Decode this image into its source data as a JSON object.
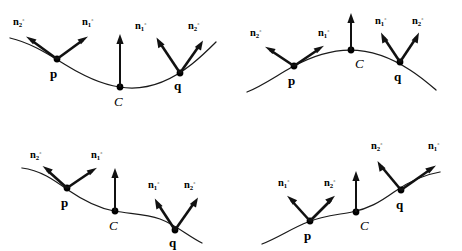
{
  "figure": {
    "background_color": "#ffffff",
    "stroke_color": "#111111",
    "curve_color": "#1a1a1a",
    "width": 462,
    "height": 251,
    "labels": {
      "n1": "n",
      "n2": "n",
      "sub1": "1",
      "sub2": "2",
      "sup_degree": "◦",
      "point_p": "p",
      "point_q": "q",
      "curve_c": "C"
    }
  },
  "panels": [
    {
      "id": "panel-top-left",
      "name": "concave-up-valley",
      "curve_shape": "valley",
      "description": "Concave-up curve with minimum at C",
      "points": [
        {
          "name": "p",
          "label": "p",
          "vectors": [
            {
              "name": "n2",
              "label_sub": "2",
              "direction": "up-left"
            },
            {
              "name": "n1",
              "label_sub": "1",
              "direction": "up-right"
            }
          ]
        },
        {
          "name": "C",
          "label": "C",
          "vectors": [
            {
              "name": "normal",
              "label_sub": "",
              "direction": "up"
            }
          ]
        },
        {
          "name": "q",
          "label": "q",
          "vectors": [
            {
              "name": "n1",
              "label_sub": "1",
              "direction": "up-left"
            },
            {
              "name": "n2",
              "label_sub": "2",
              "direction": "up-right"
            }
          ]
        }
      ]
    },
    {
      "id": "panel-top-right",
      "name": "concave-down-hill",
      "curve_shape": "hill",
      "description": "Concave-down curve with maximum at C",
      "points": [
        {
          "name": "p",
          "label": "p",
          "vectors": [
            {
              "name": "n2",
              "label_sub": "2",
              "direction": "up-left"
            },
            {
              "name": "n1",
              "label_sub": "1",
              "direction": "up-right"
            }
          ]
        },
        {
          "name": "C",
          "label": "C",
          "vectors": [
            {
              "name": "normal",
              "label_sub": "",
              "direction": "up"
            }
          ]
        },
        {
          "name": "q",
          "label": "q",
          "vectors": [
            {
              "name": "n1",
              "label_sub": "1",
              "direction": "up-left"
            },
            {
              "name": "n2",
              "label_sub": "2",
              "direction": "up-right"
            }
          ]
        }
      ]
    },
    {
      "id": "panel-bottom-left",
      "name": "descending-s-curve",
      "curve_shape": "s-descending",
      "description": "Descending S-curve with inflection at C",
      "points": [
        {
          "name": "p",
          "label": "p",
          "vectors": [
            {
              "name": "n2",
              "label_sub": "2",
              "direction": "up-left"
            },
            {
              "name": "n1",
              "label_sub": "1",
              "direction": "up-right"
            }
          ]
        },
        {
          "name": "C",
          "label": "C",
          "vectors": [
            {
              "name": "normal",
              "label_sub": "",
              "direction": "up"
            }
          ]
        },
        {
          "name": "q",
          "label": "q",
          "vectors": [
            {
              "name": "n1",
              "label_sub": "1",
              "direction": "up-left"
            },
            {
              "name": "n2",
              "label_sub": "2",
              "direction": "up-right"
            }
          ]
        }
      ]
    },
    {
      "id": "panel-bottom-right",
      "name": "ascending-s-curve",
      "curve_shape": "s-ascending",
      "description": "Ascending S-curve with inflection at C",
      "points": [
        {
          "name": "p",
          "label": "p",
          "vectors": [
            {
              "name": "n1",
              "label_sub": "1",
              "direction": "up-left"
            },
            {
              "name": "n2",
              "label_sub": "2",
              "direction": "up-right"
            }
          ]
        },
        {
          "name": "C",
          "label": "C",
          "vectors": [
            {
              "name": "normal",
              "label_sub": "",
              "direction": "up"
            }
          ]
        },
        {
          "name": "q",
          "label": "q",
          "vectors": [
            {
              "name": "n2",
              "label_sub": "2",
              "direction": "up-left"
            },
            {
              "name": "n1",
              "label_sub": "1",
              "direction": "up-right"
            }
          ]
        }
      ]
    }
  ]
}
